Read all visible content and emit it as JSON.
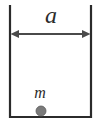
{
  "figure": {
    "caption_title": "Particle in a one-dimensional box",
    "labels": {
      "width_symbol": "a",
      "mass_symbol": "m"
    },
    "colors": {
      "stroke": "#2b2b2b",
      "background": "#ffffff",
      "particle_fill": "#7a7a7a",
      "particle_stroke": "#5c5c5c"
    },
    "geometry": {
      "left_wall_x": 10,
      "right_wall_x": 91,
      "wall_top_y": 6,
      "floor_y": 117,
      "arrow_y": 34,
      "particle_cx": 41,
      "particle_cy": 111,
      "particle_r": 5,
      "stroke_width": 2.2
    },
    "elements": {
      "container_name": "open-top rectangular well",
      "dimension_arrow": "double-headed horizontal arrow spanning box width",
      "particle": "filled circle resting on the floor"
    }
  }
}
